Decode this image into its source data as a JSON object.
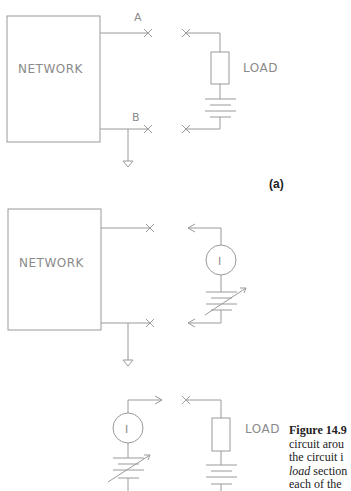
{
  "figure": {
    "panels": [
      {
        "id": "a",
        "tag": "(a)",
        "network_label": "NETWORK",
        "terminal_a_label": "A",
        "terminal_b_label": "B",
        "load_label": "LOAD"
      },
      {
        "id": "b",
        "network_label": "NETWORK",
        "source_symbol": "I"
      },
      {
        "id": "c",
        "source_symbol": "I",
        "load_label": "LOAD"
      }
    ],
    "caption": {
      "number": "Figure 14.9",
      "lines": [
        "circuit arou",
        "the circuit i",
        "section",
        "each of the"
      ],
      "italic_word": "load"
    }
  }
}
